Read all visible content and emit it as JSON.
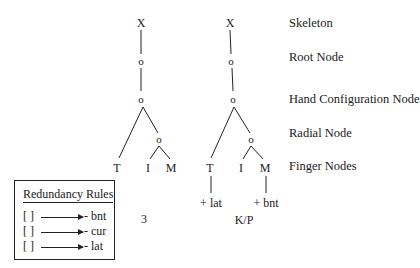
{
  "level_labels": {
    "skeleton": "Skeleton",
    "root": "Root Node",
    "hand_config": "Hand Configuration Node",
    "radial": "Radial Node",
    "finger": "Finger Nodes"
  },
  "tree_left": {
    "skeleton": "X",
    "root": "o",
    "hand_config": "o",
    "radial": "o",
    "fingers": [
      "T",
      "I",
      "M"
    ],
    "caption": "3"
  },
  "tree_right": {
    "skeleton": "X",
    "root": "o",
    "hand_config": "o",
    "radial": "o",
    "fingers": [
      "T",
      "I",
      "M"
    ],
    "thumb_feature": "+ lat",
    "middle_feature": "+ bnt",
    "caption": "K/P"
  },
  "redundancy_rules": {
    "title": "Redundancy Rules",
    "rules": [
      {
        "lhs": "[ ]",
        "rhs": "- bnt"
      },
      {
        "lhs": "[ ]",
        "rhs": "- cur"
      },
      {
        "lhs": "[ ]",
        "rhs": "- lat"
      }
    ]
  }
}
